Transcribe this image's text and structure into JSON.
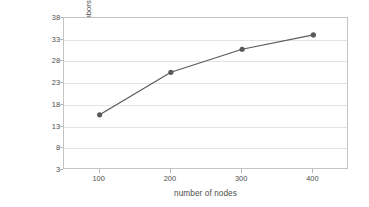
{
  "chart_data": {
    "type": "line",
    "title": "",
    "xlabel": "number of nodes",
    "ylabel": "Percent of nodes which have useful neighbors",
    "x": [
      100,
      200,
      300,
      400
    ],
    "values": [
      15.7,
      25.5,
      30.8,
      34.1
    ],
    "series": [
      {
        "name": "Percent of nodes which have useful neighbors",
        "values": [
          15.7,
          25.5,
          30.8,
          34.1
        ]
      }
    ],
    "xlim": [
      50,
      450
    ],
    "ylim": [
      3,
      38
    ],
    "xticks": [
      100,
      200,
      300,
      400
    ],
    "yticks": [
      3,
      8,
      13,
      18,
      23,
      28,
      33,
      38
    ],
    "xticklabels": [
      "100",
      "200",
      "300",
      "400"
    ],
    "yticklabels": [
      "3",
      "8",
      "13",
      "18",
      "23",
      "28",
      "33",
      "38"
    ],
    "grid": "horizontal",
    "legend": "none",
    "marker": "circle",
    "line_color": "#595959",
    "marker_color": "#595959",
    "grid_color": "#e2e2e2",
    "axis_color": "#c3c3c3",
    "background_color": "#ffffff"
  },
  "axes": {
    "y_title": "Percent of nodes which have useful neighbors",
    "x_title": "number of nodes"
  }
}
